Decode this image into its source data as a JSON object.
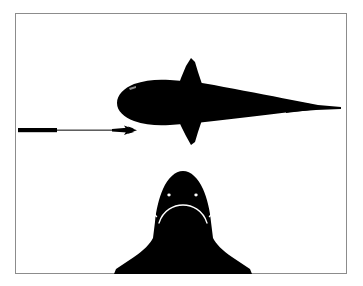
{
  "figure": {
    "background_color": "#ffffff",
    "silhouette_color": "#000000",
    "border_color": "#8c8c8c",
    "detail_color": "#ffffff",
    "width_px": 363,
    "height_px": 286
  },
  "plate": {
    "border_left": 15,
    "border_top": 13,
    "border_width": 332,
    "border_height": 261
  },
  "panels": [
    {
      "id": "dorsal-view",
      "name": "shark-dorsal-silhouette",
      "view": "dorsal",
      "description": "Shark seen from above, head at left, caudal fin at right, pectoral fins spread vertically",
      "bounds": {
        "x": 112,
        "y": 58,
        "width": 230,
        "height": 88
      }
    },
    {
      "id": "frontal-view",
      "name": "shark-frontal-silhouette",
      "view": "frontal",
      "description": "Shark head seen head-on, eyes, nostrils and mouth picked out in white",
      "bounds": {
        "x": 112,
        "y": 170,
        "width": 138,
        "height": 104
      }
    }
  ],
  "scale_indicator": {
    "name": "scale-bar-with-arrow",
    "bar_start_x": 18,
    "bar_end_x": 57,
    "bar_y": 130,
    "bar_thickness": 4,
    "line_end_x": 137,
    "arrow_direction": "right",
    "points_to": "snout of dorsal shark",
    "label": ""
  },
  "frontal_details": {
    "left_eye": {
      "cx": 169,
      "cy": 195,
      "rx": 1.6,
      "ry": 1.3
    },
    "right_eye": {
      "cx": 196,
      "cy": 195,
      "rx": 1.6,
      "ry": 1.3
    },
    "left_nostril": {
      "cx": 156,
      "cy": 210,
      "rx": 2.4,
      "ry": 5.2
    },
    "right_nostril": {
      "cx": 209,
      "cy": 210,
      "rx": 2.4,
      "ry": 5.2
    },
    "mouth": {
      "description": "white upward-opening crescent arc beneath the eyes",
      "cx": 183,
      "cy": 213
    }
  },
  "dorsal_details": {
    "snout_tip_x": 112,
    "tail_tip_x": 342,
    "body_axis_y": 103,
    "dorsal_fin_peak_y": 58,
    "lower_pectoral_tip_y": 146
  }
}
